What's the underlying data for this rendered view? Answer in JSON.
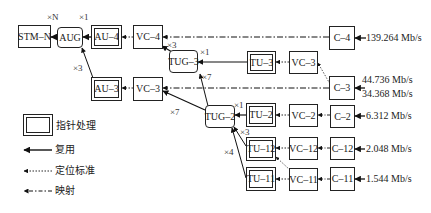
{
  "diagram": {
    "nodes": {
      "stm_n": "STM–N",
      "aug": "AUG",
      "au4": "AU–4",
      "vc4": "VC–4",
      "c4": "C–4",
      "tug3": "TUG–3",
      "tu3": "TU–3",
      "vc3_right": "VC–3",
      "c3": "C–3",
      "au3": "AU–3",
      "vc3_left": "VC–3",
      "tug2": "TUG–2",
      "tu2": "TU–2",
      "vc2": "VC–2",
      "c2": "C–2",
      "tu12": "TU–12",
      "vc12": "VC–12",
      "c12": "C–12",
      "tu11": "TU–11",
      "vc11": "VC–11",
      "c11": "C–11"
    },
    "multipliers": {
      "stm_aug": "×N",
      "aug_au4": "×1",
      "aug_au3": "×3",
      "vc4_tug3": "×3",
      "tug3_tu3": "×1",
      "tug3_tug2": "×7",
      "vc3_tug2": "×7",
      "tug2_tu2": "×1",
      "tug2_tu12": "×3",
      "tug2_tu11": "×4"
    },
    "rates": {
      "c4": "139.264 Mb/s",
      "c3_a": "44.736 Mb/s",
      "c3_b": "34.368 Mb/s",
      "c2": "6.312 Mb/s",
      "c12": "2.048 Mb/s",
      "c11": "1.544 Mb/s"
    },
    "legend": {
      "pointer_processing": "指针处理",
      "multiplexing": "复用",
      "aligning": "定位标准",
      "mapping": "映射"
    }
  }
}
